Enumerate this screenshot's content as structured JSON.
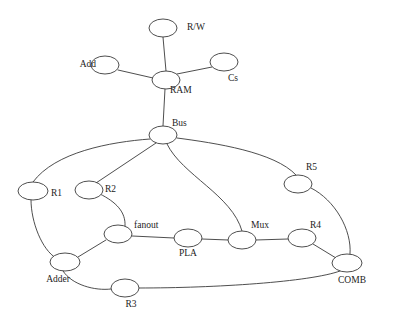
{
  "diagram": {
    "type": "node-link-graph",
    "title": "",
    "background_color": "#ffffff",
    "edge_color": "#3a3a3a",
    "node_fill_color": "#ffffff",
    "node_stroke_color": "#3a3a3a",
    "label_color": "#1c1c1c",
    "nodes": [
      {
        "id": "rw",
        "label": "R/W",
        "cx": 163,
        "cy": 28,
        "rx": 14,
        "ry": 9,
        "label_x": 187,
        "label_y": 30,
        "anchor": "start"
      },
      {
        "id": "add",
        "label": "Add",
        "cx": 105,
        "cy": 65,
        "rx": 14,
        "ry": 9,
        "label_x": 96,
        "label_y": 67,
        "anchor": "end"
      },
      {
        "id": "ram",
        "label": "RAM",
        "cx": 166,
        "cy": 80,
        "rx": 14,
        "ry": 9,
        "label_x": 170,
        "label_y": 93,
        "anchor": "start"
      },
      {
        "id": "cs",
        "label": "Cs",
        "cx": 224,
        "cy": 62,
        "rx": 14,
        "ry": 9,
        "label_x": 228,
        "label_y": 81,
        "anchor": "start"
      },
      {
        "id": "bus",
        "label": "Bus",
        "cx": 163,
        "cy": 135,
        "rx": 14,
        "ry": 9,
        "label_x": 172,
        "label_y": 126,
        "anchor": "start"
      },
      {
        "id": "r1",
        "label": "R1",
        "cx": 33,
        "cy": 191,
        "rx": 15,
        "ry": 9,
        "label_x": 51,
        "label_y": 196,
        "anchor": "start"
      },
      {
        "id": "r2",
        "label": "R2",
        "cx": 89,
        "cy": 190,
        "rx": 14,
        "ry": 9,
        "label_x": 105,
        "label_y": 192,
        "anchor": "start"
      },
      {
        "id": "r5",
        "label": "R5",
        "cx": 298,
        "cy": 184,
        "rx": 14,
        "ry": 9,
        "label_x": 306,
        "label_y": 170,
        "anchor": "start"
      },
      {
        "id": "fanout",
        "label": "fanout",
        "cx": 118,
        "cy": 234,
        "rx": 14,
        "ry": 9,
        "label_x": 134,
        "label_y": 228,
        "anchor": "start"
      },
      {
        "id": "pla",
        "label": "PLA",
        "cx": 188,
        "cy": 238,
        "rx": 14,
        "ry": 9,
        "label_x": 188,
        "label_y": 256,
        "anchor": "middle"
      },
      {
        "id": "mux",
        "label": "Mux",
        "cx": 242,
        "cy": 240,
        "rx": 14,
        "ry": 9,
        "label_x": 251,
        "label_y": 228,
        "anchor": "start"
      },
      {
        "id": "r4",
        "label": "R4",
        "cx": 302,
        "cy": 238,
        "rx": 14,
        "ry": 9,
        "label_x": 310,
        "label_y": 228,
        "anchor": "start"
      },
      {
        "id": "adder",
        "label": "Adder",
        "cx": 65,
        "cy": 262,
        "rx": 15,
        "ry": 9,
        "label_x": 58,
        "label_y": 282,
        "anchor": "middle"
      },
      {
        "id": "r3",
        "label": "R3",
        "cx": 125,
        "cy": 288,
        "rx": 14,
        "ry": 9,
        "label_x": 131,
        "label_y": 307,
        "anchor": "middle"
      },
      {
        "id": "comb",
        "label": "COMB",
        "cx": 347,
        "cy": 263,
        "rx": 15,
        "ry": 9,
        "label_x": 352,
        "label_y": 283,
        "anchor": "middle"
      }
    ],
    "edges": [
      {
        "id": "rw-ram",
        "source": "rw",
        "target": "ram",
        "path": "M 163 37 L 166 71"
      },
      {
        "id": "add-ram",
        "source": "add",
        "target": "ram",
        "path": "M 118 70 L 153 78"
      },
      {
        "id": "ram-cs",
        "source": "ram",
        "target": "cs",
        "path": "M 177 74 L 212 67"
      },
      {
        "id": "ram-bus",
        "source": "ram",
        "target": "bus",
        "path": "M 165 89 L 163 126"
      },
      {
        "id": "bus-r1",
        "source": "bus",
        "target": "r1",
        "path": "M 150 139 C 110 142 55 152 33 182"
      },
      {
        "id": "bus-r2",
        "source": "bus",
        "target": "r2",
        "path": "M 156 143 L 96 183"
      },
      {
        "id": "bus-r5",
        "source": "bus",
        "target": "r5",
        "path": "M 177 138 C 215 143 275 152 296 175"
      },
      {
        "id": "bus-mux",
        "source": "bus",
        "target": "mux",
        "path": "M 167 144 C 182 175 232 195 242 231"
      },
      {
        "id": "r1-adder",
        "source": "r1",
        "target": "adder",
        "path": "M 31 200 C 31 222 42 250 56 258"
      },
      {
        "id": "r2-fanout",
        "source": "r2",
        "target": "fanout",
        "path": "M 100 194 C 116 202 126 212 125 226"
      },
      {
        "id": "fanout-pla",
        "source": "fanout",
        "target": "pla",
        "path": "M 132 236 L 174 238"
      },
      {
        "id": "pla-mux",
        "source": "pla",
        "target": "mux",
        "path": "M 202 239 L 228 240"
      },
      {
        "id": "mux-r4",
        "source": "mux",
        "target": "r4",
        "path": "M 256 240 L 288 239"
      },
      {
        "id": "fanout-adder",
        "source": "fanout",
        "target": "adder",
        "path": "M 106 240 L 78 257"
      },
      {
        "id": "adder-r3",
        "source": "adder",
        "target": "r3",
        "path": "M 63 271 C 72 285 95 291 111 289"
      },
      {
        "id": "r3-comb",
        "source": "r3",
        "target": "comb",
        "path": "M 139 288 C 215 288 310 282 340 271"
      },
      {
        "id": "r4-comb",
        "source": "r4",
        "target": "comb",
        "path": "M 313 244 L 336 258"
      },
      {
        "id": "r5-comb",
        "source": "r5",
        "target": "comb",
        "path": "M 311 188 C 335 200 352 230 350 254"
      }
    ]
  }
}
